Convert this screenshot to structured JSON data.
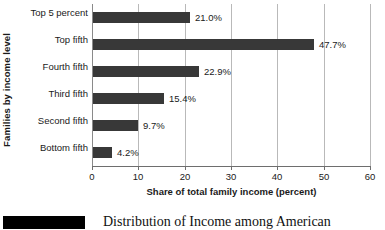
{
  "chart_data": {
    "type": "bar",
    "orientation": "horizontal",
    "title": "",
    "xlabel": "Share of total family income (percent)",
    "ylabel": "Families by income level",
    "xlim": [
      0,
      60
    ],
    "xticks": [
      0,
      10,
      20,
      30,
      40,
      50,
      60
    ],
    "xtick_labels": [
      "0",
      "10",
      "20",
      "30",
      "40",
      "50",
      "60"
    ],
    "grid": "vertical",
    "legend": "none",
    "bar_color": "#383838",
    "categories": [
      "Top 5 percent",
      "Top fifth",
      "Fourth fifth",
      "Third fifth",
      "Second fifth",
      "Bottom fifth"
    ],
    "values": [
      21.0,
      47.7,
      22.9,
      15.4,
      9.7,
      4.2
    ],
    "data_labels": [
      "21.0%",
      "47.7%",
      "22.9%",
      "15.4%",
      "9.7%",
      "4.2%"
    ]
  },
  "caption": {
    "text": "Distribution of Income among American",
    "swatch_color": "#000000"
  }
}
